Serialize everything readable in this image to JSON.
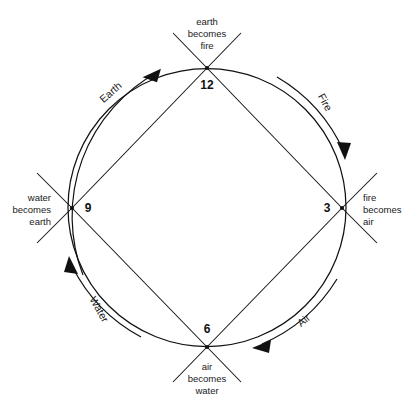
{
  "diagram": {
    "type": "cyclic-transformation-diagram",
    "geometry": {
      "center_x": 207,
      "center_y": 207,
      "radius": 139
    },
    "colors": {
      "stroke": "#111111",
      "text": "#1a1a1a",
      "background": "#ffffff"
    },
    "nodes": [
      {
        "id": "node-12",
        "number": "12",
        "label_line1": "earth",
        "label_line2": "becomes",
        "label_line3": "fire",
        "position": "top",
        "x": 207,
        "y": 68
      },
      {
        "id": "node-3",
        "number": "3",
        "label_line1": "fire",
        "label_line2": "becomes",
        "label_line3": "air",
        "position": "right",
        "x": 342,
        "y": 208
      },
      {
        "id": "node-6",
        "number": "6",
        "label_line1": "air",
        "label_line2": "becomes",
        "label_line3": "water",
        "position": "bottom",
        "x": 207,
        "y": 347
      },
      {
        "id": "node-9",
        "number": "9",
        "label_line1": "water",
        "label_line2": "becomes",
        "label_line3": "earth",
        "position": "left",
        "x": 72,
        "y": 208
      }
    ],
    "arcs": [
      {
        "id": "arc-earth",
        "label": "Earth",
        "from": "node-9",
        "to": "node-12",
        "quadrant": "upper-left",
        "direction": "clockwise"
      },
      {
        "id": "arc-fire",
        "label": "Fire",
        "from": "node-12",
        "to": "node-3",
        "quadrant": "upper-right",
        "direction": "clockwise"
      },
      {
        "id": "arc-air",
        "label": "Air",
        "from": "node-3",
        "to": "node-6",
        "quadrant": "lower-right",
        "direction": "clockwise"
      },
      {
        "id": "arc-water",
        "label": "Water",
        "from": "node-6",
        "to": "node-9",
        "quadrant": "lower-left",
        "direction": "clockwise"
      }
    ]
  }
}
